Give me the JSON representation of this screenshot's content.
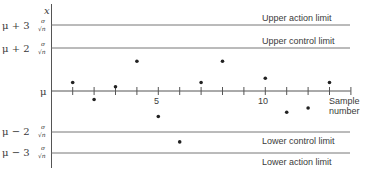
{
  "chart_data": {
    "type": "scatter",
    "title": "",
    "xlabel": "Sample number",
    "ylabel": "x",
    "x_ticks_labeled": [
      {
        "value": 5,
        "label": "5"
      },
      {
        "value": 10,
        "label": "10"
      }
    ],
    "xlim": [
      0,
      14
    ],
    "ylim_units": "sigma/sqrt(n) from mu",
    "ylim": [
      -3.6,
      4.1
    ],
    "grid": false,
    "legend": null,
    "center_line": {
      "value": 0,
      "label": "μ"
    },
    "limits": [
      {
        "name": "upper-action",
        "value": 3,
        "axis_label": "μ+3 σ/√n",
        "text": "Upper action limit"
      },
      {
        "name": "upper-control",
        "value": 2,
        "axis_label": "μ+2 σ/√n",
        "text": "Upper control limit"
      },
      {
        "name": "lower-control",
        "value": -2,
        "axis_label": "μ−2 σ/√n",
        "text": "Lower control limit"
      },
      {
        "name": "lower-action",
        "value": -3,
        "axis_label": "μ−3 σ/√n",
        "text": "Lower action limit"
      }
    ],
    "points": [
      {
        "x": 1,
        "y": 0.4
      },
      {
        "x": 2,
        "y": -0.4
      },
      {
        "x": 3,
        "y": 0.2
      },
      {
        "x": 4,
        "y": 1.4
      },
      {
        "x": 5,
        "y": -1.2
      },
      {
        "x": 6,
        "y": -2.4
      },
      {
        "x": 7,
        "y": 0.4
      },
      {
        "x": 8,
        "y": 1.4
      },
      {
        "x": 10,
        "y": 0.6
      },
      {
        "x": 11,
        "y": -1.0
      },
      {
        "x": 12,
        "y": -0.8
      },
      {
        "x": 13,
        "y": 0.4
      }
    ]
  },
  "labels": {
    "y_axis": "x",
    "mu": "μ",
    "x_label_line1": "Sample",
    "x_label_line2": "number",
    "tick5": "5",
    "tick10": "10",
    "ua_prefix": "μ + 3",
    "uc_prefix": "μ + 2",
    "lc_prefix": "μ − 2",
    "la_prefix": "μ − 3",
    "sigma": "σ",
    "sqrtn": "√n",
    "upper_action": "Upper action limit",
    "upper_control": "Upper control limit",
    "lower_control": "Lower control limit",
    "lower_action": "Lower action limit"
  }
}
